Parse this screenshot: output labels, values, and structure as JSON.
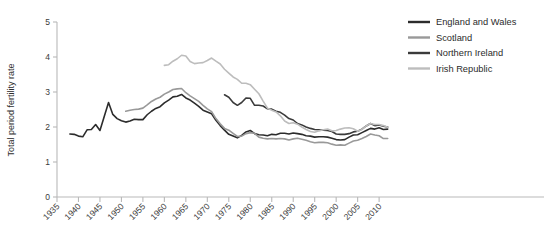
{
  "chart_data": {
    "type": "line",
    "title": "",
    "xlabel": "",
    "ylabel": "Total period fertility rate",
    "xlim": [
      1935,
      2013
    ],
    "ylim": [
      0,
      5
    ],
    "yticks": [
      0,
      1,
      2,
      3,
      4,
      5
    ],
    "xticks": [
      1935,
      1940,
      1945,
      1950,
      1955,
      1960,
      1965,
      1970,
      1975,
      1980,
      1985,
      1990,
      1995,
      2000,
      2005,
      2010
    ],
    "grid": false,
    "legend_position": "top-right",
    "series": [
      {
        "name": "England and Wales",
        "color": "#2c2c2c",
        "x": [
          1938,
          1939,
          1940,
          1941,
          1942,
          1943,
          1944,
          1945,
          1946,
          1947,
          1948,
          1949,
          1950,
          1951,
          1952,
          1953,
          1954,
          1955,
          1956,
          1957,
          1958,
          1959,
          1960,
          1961,
          1962,
          1963,
          1964,
          1965,
          1966,
          1967,
          1968,
          1969,
          1970,
          1971,
          1972,
          1973,
          1974,
          1975,
          1976,
          1977,
          1978,
          1979,
          1980,
          1981,
          1982,
          1983,
          1984,
          1985,
          1986,
          1987,
          1988,
          1989,
          1990,
          1991,
          1992,
          1993,
          1994,
          1995,
          1996,
          1997,
          1998,
          1999,
          2000,
          2001,
          2002,
          2003,
          2004,
          2005,
          2006,
          2007,
          2008,
          2009,
          2010,
          2011,
          2012
        ],
        "values": [
          1.8,
          1.79,
          1.74,
          1.72,
          1.92,
          1.93,
          2.07,
          1.9,
          2.3,
          2.7,
          2.36,
          2.24,
          2.18,
          2.14,
          2.17,
          2.22,
          2.21,
          2.21,
          2.35,
          2.45,
          2.53,
          2.58,
          2.69,
          2.77,
          2.86,
          2.88,
          2.93,
          2.83,
          2.77,
          2.68,
          2.59,
          2.48,
          2.43,
          2.38,
          2.19,
          2.04,
          1.91,
          1.79,
          1.74,
          1.69,
          1.76,
          1.86,
          1.9,
          1.81,
          1.78,
          1.77,
          1.75,
          1.79,
          1.78,
          1.82,
          1.82,
          1.8,
          1.83,
          1.81,
          1.79,
          1.75,
          1.74,
          1.71,
          1.72,
          1.72,
          1.71,
          1.68,
          1.64,
          1.63,
          1.64,
          1.71,
          1.77,
          1.78,
          1.84,
          1.9,
          1.96,
          1.94,
          1.98,
          1.93,
          1.94
        ]
      },
      {
        "name": "Scotland",
        "color": "#999999",
        "x": [
          1951,
          1952,
          1953,
          1954,
          1955,
          1956,
          1957,
          1958,
          1959,
          1960,
          1961,
          1962,
          1963,
          1964,
          1965,
          1966,
          1967,
          1968,
          1969,
          1970,
          1971,
          1972,
          1973,
          1974,
          1975,
          1976,
          1977,
          1978,
          1979,
          1980,
          1981,
          1982,
          1983,
          1984,
          1985,
          1986,
          1987,
          1988,
          1989,
          1990,
          1991,
          1992,
          1993,
          1994,
          1995,
          1996,
          1997,
          1998,
          1999,
          2000,
          2001,
          2002,
          2003,
          2004,
          2005,
          2006,
          2007,
          2008,
          2009,
          2010,
          2011,
          2012
        ],
        "values": [
          2.45,
          2.48,
          2.5,
          2.51,
          2.54,
          2.63,
          2.73,
          2.8,
          2.85,
          2.94,
          3.0,
          3.07,
          3.09,
          3.1,
          2.98,
          2.89,
          2.81,
          2.73,
          2.62,
          2.52,
          2.44,
          2.24,
          2.09,
          1.96,
          1.91,
          1.82,
          1.73,
          1.74,
          1.81,
          1.84,
          1.82,
          1.71,
          1.68,
          1.66,
          1.67,
          1.66,
          1.67,
          1.66,
          1.63,
          1.66,
          1.68,
          1.65,
          1.62,
          1.58,
          1.55,
          1.56,
          1.56,
          1.55,
          1.51,
          1.48,
          1.49,
          1.48,
          1.54,
          1.6,
          1.62,
          1.67,
          1.73,
          1.8,
          1.77,
          1.75,
          1.67,
          1.67
        ]
      },
      {
        "name": "Northern Ireland",
        "color": "#3b3b3b",
        "x": [
          1974,
          1975,
          1976,
          1977,
          1978,
          1979,
          1980,
          1981,
          1982,
          1983,
          1984,
          1985,
          1986,
          1987,
          1988,
          1989,
          1990,
          1991,
          1992,
          1993,
          1994,
          1995,
          1996,
          1997,
          1998,
          1999,
          2000,
          2001,
          2002,
          2003,
          2004,
          2005,
          2006,
          2007,
          2008,
          2009,
          2010,
          2011,
          2012
        ],
        "values": [
          2.92,
          2.85,
          2.7,
          2.62,
          2.7,
          2.83,
          2.82,
          2.62,
          2.62,
          2.6,
          2.52,
          2.51,
          2.45,
          2.42,
          2.34,
          2.24,
          2.2,
          2.1,
          2.06,
          2.0,
          1.96,
          1.93,
          1.92,
          1.91,
          1.9,
          1.87,
          1.8,
          1.79,
          1.79,
          1.81,
          1.86,
          1.88,
          1.94,
          2.03,
          2.1,
          2.04,
          2.06,
          2.02,
          2.0
        ]
      },
      {
        "name": "Irish Republic",
        "color": "#bdbdbd",
        "x": [
          1960,
          1961,
          1962,
          1963,
          1964,
          1965,
          1966,
          1967,
          1968,
          1969,
          1970,
          1971,
          1972,
          1973,
          1974,
          1975,
          1976,
          1977,
          1978,
          1979,
          1980,
          1981,
          1982,
          1983,
          1984,
          1985,
          1986,
          1987,
          1988,
          1989,
          1990,
          1991,
          1992,
          1993,
          1994,
          1995,
          1996,
          1997,
          1998,
          1999,
          2000,
          2001,
          2002,
          2003,
          2004,
          2005,
          2006,
          2007,
          2008,
          2009,
          2010,
          2011,
          2012
        ],
        "values": [
          3.76,
          3.78,
          3.88,
          3.95,
          4.05,
          4.03,
          3.87,
          3.81,
          3.83,
          3.84,
          3.9,
          3.97,
          3.88,
          3.8,
          3.65,
          3.54,
          3.43,
          3.36,
          3.25,
          3.25,
          3.21,
          3.08,
          2.95,
          2.74,
          2.54,
          2.48,
          2.43,
          2.32,
          2.17,
          2.1,
          2.12,
          2.08,
          2.0,
          1.93,
          1.87,
          1.85,
          1.89,
          1.92,
          1.94,
          1.89,
          1.9,
          1.94,
          1.97,
          1.98,
          1.95,
          1.88,
          1.93,
          2.03,
          2.1,
          2.07,
          2.07,
          2.04,
          1.99
        ]
      }
    ]
  },
  "legend": {
    "items": [
      {
        "label": "England and Wales",
        "color": "#2c2c2c"
      },
      {
        "label": "Scotland",
        "color": "#999999"
      },
      {
        "label": "Northern Ireland",
        "color": "#3b3b3b"
      },
      {
        "label": "Irish Republic",
        "color": "#bdbdbd"
      }
    ]
  }
}
